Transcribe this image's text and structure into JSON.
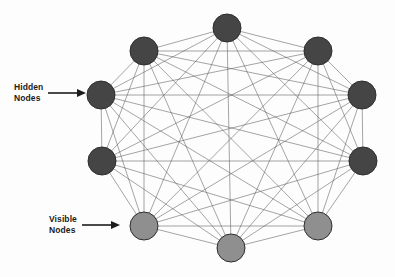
{
  "figure": {
    "background_color": "#fdfdfd",
    "edge_color": "#5a5a5a",
    "edge_width": 0.55
  },
  "annotations": [
    {
      "id": "hidden",
      "label": "Hidden\nNodes",
      "icon": "arrow-right-icon",
      "points_to_node": "hidden-left",
      "x": 14,
      "y": 82
    },
    {
      "id": "visible",
      "label": "Visible\nNodes",
      "icon": "arrow-right-icon",
      "points_to_node": "visible-lower-left",
      "x": 49,
      "y": 214
    }
  ],
  "legend_groups": [
    {
      "name": "Hidden Nodes",
      "color": "#454545",
      "count": 7
    },
    {
      "name": "Visible Nodes",
      "color": "#8f8f8f",
      "count": 3
    }
  ],
  "chart_data": {
    "type": "graph",
    "xlabel": "",
    "ylabel": "",
    "xlim": [
      0,
      395
    ],
    "ylim": [
      0,
      277
    ],
    "grid": false,
    "legend_position": "left",
    "fully_connected": true,
    "edge_count": 45,
    "node_radius": 13,
    "nodes": [
      {
        "id": "hidden-top",
        "group": "hidden",
        "label": "Hidden Node 1",
        "x": 227,
        "y": 28,
        "r": 14,
        "color": "#454545"
      },
      {
        "id": "hidden-top-left",
        "group": "hidden",
        "label": "Hidden Node 2",
        "x": 144,
        "y": 51,
        "r": 14,
        "color": "#454545"
      },
      {
        "id": "hidden-top-right",
        "group": "hidden",
        "label": "Hidden Node 3",
        "x": 318,
        "y": 51,
        "r": 14,
        "color": "#454545"
      },
      {
        "id": "hidden-left",
        "group": "hidden",
        "label": "Hidden Node 4",
        "x": 101,
        "y": 95,
        "r": 14,
        "color": "#454545"
      },
      {
        "id": "hidden-right",
        "group": "hidden",
        "label": "Hidden Node 5",
        "x": 362,
        "y": 95,
        "r": 14,
        "color": "#454545"
      },
      {
        "id": "hidden-lower-left",
        "group": "hidden",
        "label": "Hidden Node 6",
        "x": 102,
        "y": 161,
        "r": 14,
        "color": "#454545"
      },
      {
        "id": "hidden-lower-right",
        "group": "hidden",
        "label": "Hidden Node 7",
        "x": 363,
        "y": 161,
        "r": 14,
        "color": "#454545"
      },
      {
        "id": "visible-lower-left",
        "group": "visible",
        "label": "Visible Node 1",
        "x": 144,
        "y": 226,
        "r": 14,
        "color": "#8f8f8f"
      },
      {
        "id": "visible-bottom",
        "group": "visible",
        "label": "Visible Node 2",
        "x": 231,
        "y": 248,
        "r": 14,
        "color": "#8f8f8f"
      },
      {
        "id": "visible-lower-right",
        "group": "visible",
        "label": "Visible Node 3",
        "x": 318,
        "y": 226,
        "r": 14,
        "color": "#8f8f8f"
      }
    ]
  }
}
